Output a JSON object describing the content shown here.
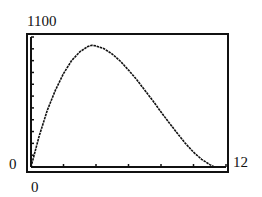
{
  "chart_data": {
    "type": "line",
    "title": "",
    "xlabel": "",
    "ylabel": "",
    "xlim": [
      0,
      12
    ],
    "ylim": [
      0,
      1100
    ],
    "x_tick_interval": 2,
    "y_tick_interval": 100,
    "grid": false,
    "labels": {
      "ymax": "1100",
      "ymin": "0",
      "xmin": "0",
      "xmax": "12"
    },
    "series": [
      {
        "name": "curve",
        "x": [
          0,
          0.5,
          1,
          1.5,
          2,
          2.5,
          3,
          3.5,
          3.75,
          4,
          4.5,
          5,
          5.5,
          6,
          6.5,
          7,
          7.5,
          8,
          8.5,
          9,
          9.5,
          10,
          10.5,
          11,
          11.3
        ],
        "y": [
          0,
          260,
          480,
          650,
          790,
          900,
          975,
          1020,
          1030,
          1025,
          1000,
          955,
          895,
          820,
          740,
          650,
          560,
          465,
          375,
          285,
          200,
          125,
          65,
          20,
          0
        ]
      }
    ]
  }
}
